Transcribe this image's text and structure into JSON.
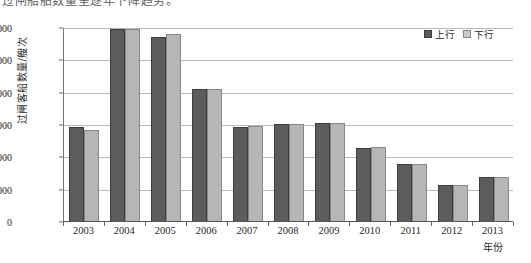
{
  "page": {
    "top_fragment": "过闸船舶数量呈逐年下降趋势。"
  },
  "legend": {
    "position": "top-right",
    "items": [
      {
        "label": "上行",
        "color": "#5c5c5c",
        "icon": "legend-swatch-up"
      },
      {
        "label": "下行",
        "color": "#b6b6b6",
        "icon": "legend-swatch-down"
      }
    ]
  },
  "axes": {
    "ylabel": "过闸客船数量/艘次",
    "xlabel": "年份",
    "yticks": [
      "0",
      "1000",
      "2000",
      "3000",
      "4000",
      "5000",
      "6000"
    ]
  },
  "chart_data": {
    "type": "bar",
    "title": "",
    "xlabel": "年份",
    "ylabel": "过闸客船数量/艘次",
    "categories": [
      "2003",
      "2004",
      "2005",
      "2006",
      "2007",
      "2008",
      "2009",
      "2010",
      "2011",
      "2012",
      "2013"
    ],
    "series": [
      {
        "name": "上行",
        "color": "#5c5c5c",
        "values": [
          2900,
          5950,
          5680,
          4080,
          2920,
          3000,
          3030,
          2270,
          1750,
          1100,
          1350
        ]
      },
      {
        "name": "下行",
        "color": "#b6b6b6",
        "values": [
          2820,
          5950,
          5790,
          4080,
          2930,
          3010,
          3040,
          2280,
          1770,
          1100,
          1350
        ]
      }
    ],
    "ylim": [
      0,
      6000
    ],
    "ytick_step": 1000,
    "grid": true,
    "legend_position": "top-right"
  },
  "colors": {
    "bar_up": "#5c5c5c",
    "bar_down": "#b6b6b6",
    "grid": "#b9b9b9",
    "axis": "#555555",
    "background": "#ffffff"
  }
}
